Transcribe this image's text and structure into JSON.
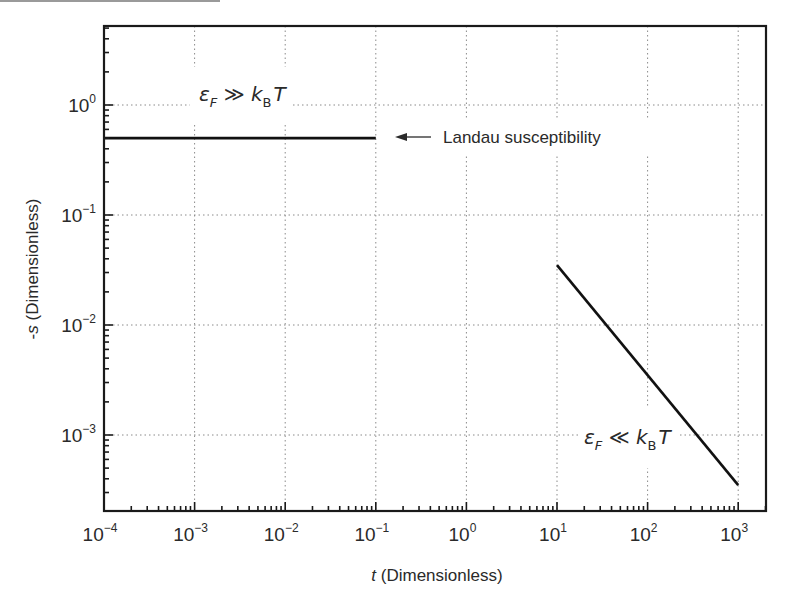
{
  "chart_data": {
    "type": "line",
    "title": "",
    "xlabel": "t (Dimensionless)",
    "xlabel_italic_part": "t",
    "xlabel_rest": " (Dimensionless)",
    "ylabel": "-s (Dimensionless)",
    "ylabel_prefix": "-",
    "ylabel_italic_part": "s",
    "ylabel_rest": " (Dimensionless)",
    "xscale": "log",
    "yscale": "log",
    "xlim": [
      0.0001,
      2000
    ],
    "ylim": [
      0.0002,
      5.2
    ],
    "grid": true,
    "grid_style": "dotted",
    "x_ticks": [
      {
        "exp": "-4",
        "value": 0.0001
      },
      {
        "exp": "-3",
        "value": 0.001
      },
      {
        "exp": "-2",
        "value": 0.01
      },
      {
        "exp": "-1",
        "value": 0.1
      },
      {
        "exp": "0",
        "value": 1
      },
      {
        "exp": "1",
        "value": 10
      },
      {
        "exp": "2",
        "value": 100
      },
      {
        "exp": "3",
        "value": 1000
      }
    ],
    "y_ticks": [
      {
        "exp": "0",
        "value": 1
      },
      {
        "exp": "-1",
        "value": 0.1
      },
      {
        "exp": "-2",
        "value": 0.01
      },
      {
        "exp": "-3",
        "value": 0.001
      }
    ],
    "series": [
      {
        "name": "Landau susceptibility (degenerate limit)",
        "x": [
          0.0001,
          0.1
        ],
        "y": [
          0.5,
          0.5
        ]
      },
      {
        "name": "Non-degenerate limit (~1/t)",
        "x": [
          10,
          1000
        ],
        "y": [
          0.035,
          0.00035
        ]
      }
    ],
    "annotations": [
      {
        "text": "εF ≫ kB T",
        "main": "ε",
        "sub1": "F",
        "rel": " ≫ k",
        "sub2": "B",
        "tail": "T",
        "x": 0.004,
        "y": 1.0
      },
      {
        "text": "εF ≪ kB T",
        "main": "ε",
        "sub1": "F",
        "rel": " ≪ k",
        "sub2": "B",
        "tail": "T",
        "x": 120,
        "y": 0.001
      },
      {
        "text": "Landau susceptibility",
        "arrow_to_series": 0,
        "x": 0.6,
        "y": 0.5
      }
    ]
  },
  "tick_base": "10"
}
